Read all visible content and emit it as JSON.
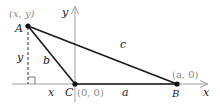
{
  "diagram": {
    "type": "coordinate-triangle",
    "colors": {
      "axis": "#a0a0a0",
      "side": "#1a1a1a",
      "dashed": "#333333",
      "label": "#222222",
      "coord_label": "#888888"
    },
    "axes": {
      "x_label": "x",
      "y_label": "y"
    },
    "points": [
      {
        "name": "A",
        "coord_label": "(x, y)"
      },
      {
        "name": "C",
        "coord_label": "(0, 0)"
      },
      {
        "name": "B",
        "coord_label": "(a, 0)"
      }
    ],
    "sides": [
      {
        "name": "a",
        "from": "C",
        "to": "B"
      },
      {
        "name": "b",
        "from": "A",
        "to": "C"
      },
      {
        "name": "c",
        "from": "A",
        "to": "B"
      }
    ],
    "projection": {
      "height_label": "y",
      "base_label": "x",
      "right_angle": true
    }
  }
}
